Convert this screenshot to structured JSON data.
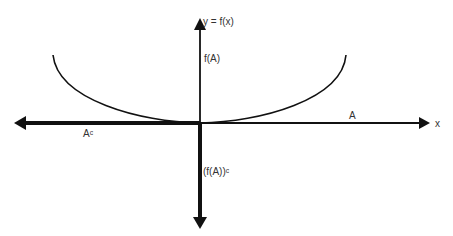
{
  "diagram": {
    "title_label": "y = f(x)",
    "x_axis_label": "x",
    "image_label": "f(A)",
    "image_complement_label": "(f(A))ᶜ",
    "set_label": "A",
    "set_complement_label": "Aᶜ",
    "colors": {
      "stroke": "#111111",
      "text": "#333333",
      "background": "#ffffff"
    },
    "curve": {
      "shape": "parabola-like U",
      "left_end": [
        53,
        55
      ],
      "vertex": [
        200,
        123
      ],
      "right_end": [
        346,
        55
      ]
    },
    "axes": {
      "horizontal": {
        "y": 123,
        "x_start": 15,
        "x_end": 430,
        "thick_segment": [
          15,
          200
        ],
        "thin_segment": [
          200,
          430
        ]
      },
      "vertical": {
        "x": 200,
        "y_start": 18,
        "y_end": 230,
        "thin_segment": [
          18,
          123
        ],
        "thick_segment": [
          123,
          230
        ]
      }
    }
  }
}
